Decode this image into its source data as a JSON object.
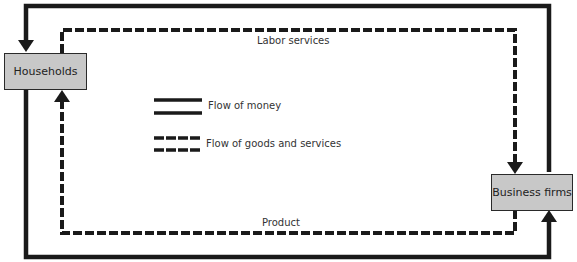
{
  "nodes": {
    "households": {
      "label": "Households"
    },
    "business_firms": {
      "label": "Business firms"
    }
  },
  "flows": {
    "labor_services": {
      "label": "Labor services",
      "style": "dashed",
      "from": "Households",
      "to": "Business firms"
    },
    "product": {
      "label": "Product",
      "style": "dashed",
      "from": "Business firms",
      "to": "Households"
    },
    "money_to_households": {
      "label": "",
      "style": "solid",
      "from": "Business firms",
      "to": "Households"
    },
    "money_to_firms": {
      "label": "",
      "style": "solid",
      "from": "Households",
      "to": "Business firms"
    }
  },
  "legend": {
    "money": {
      "label": "Flow of money",
      "style": "double-solid"
    },
    "goods": {
      "label": "Flow of goods and services",
      "style": "double-dashed"
    }
  },
  "colors": {
    "line": "#1a1a1a",
    "box_fill": "#c8c8c8"
  }
}
